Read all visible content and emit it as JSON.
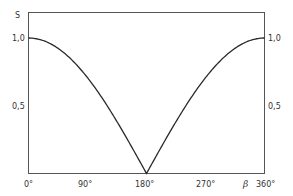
{
  "chart_data": {
    "type": "line",
    "title": "",
    "xlabel": "β",
    "ylabel": "S",
    "xlim": [
      0,
      360
    ],
    "ylim": [
      0,
      1.0
    ],
    "x_ticks": [
      "0°",
      "90°",
      "180°",
      "270°",
      "360°"
    ],
    "x_tick_values": [
      0,
      90,
      180,
      270,
      360
    ],
    "y_ticks_left": [
      "1,0",
      "0,5"
    ],
    "y_ticks_right": [
      "1,0",
      "0,5"
    ],
    "y_tick_values": [
      1.0,
      0.5
    ],
    "grid": false,
    "legend": null,
    "series": [
      {
        "name": "S(β)",
        "x": [
          0,
          30,
          60,
          90,
          120,
          150,
          180,
          210,
          240,
          270,
          300,
          330,
          360
        ],
        "values": [
          1.0,
          0.97,
          0.87,
          0.71,
          0.5,
          0.26,
          0.0,
          0.26,
          0.5,
          0.71,
          0.87,
          0.97,
          1.0
        ]
      }
    ]
  },
  "labels": {
    "y_axis": "S",
    "x_axis": "β",
    "y_left_top": "1,0",
    "y_left_mid": "0,5",
    "y_right_top": "1,0",
    "y_right_mid": "0,5",
    "x0": "0°",
    "x90": "90°",
    "x180": "180°",
    "x270": "270°",
    "x360": "360°"
  },
  "colors": {
    "line": "#2a2a2a",
    "frame": "#555555",
    "background": "#ffffff"
  }
}
